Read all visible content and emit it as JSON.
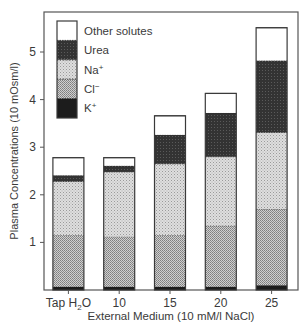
{
  "chart_data": {
    "type": "bar",
    "stacked": true,
    "title": "",
    "xlabel": "External Medium (10 mM/l NaCl)",
    "ylabel": "Plasma Concentrations (10 mOsm/l)",
    "ylim": [
      0,
      5.7
    ],
    "yticks": [
      1,
      2,
      3,
      4,
      5
    ],
    "grid": false,
    "legend_position": "top-left",
    "categories": [
      "Tap H2O",
      "10",
      "15",
      "20",
      "25"
    ],
    "category_labels": [
      {
        "main": "Tap H",
        "sub": "2",
        "tail": "O"
      },
      {
        "main": "10",
        "sub": "",
        "tail": ""
      },
      {
        "main": "15",
        "sub": "",
        "tail": ""
      },
      {
        "main": "20",
        "sub": "",
        "tail": ""
      },
      {
        "main": "25",
        "sub": "",
        "tail": ""
      }
    ],
    "series": [
      {
        "name": "K+",
        "label": "K",
        "sup": "+",
        "pattern": "dark",
        "values": [
          0.07,
          0.07,
          0.07,
          0.07,
          0.1
        ]
      },
      {
        "name": "Cl-",
        "label": "Cl",
        "sup": "−",
        "pattern": "dense-dots",
        "values": [
          1.08,
          1.05,
          1.08,
          1.28,
          1.6
        ]
      },
      {
        "name": "Na+",
        "label": "Na",
        "sup": "+",
        "pattern": "light-dots",
        "values": [
          1.13,
          1.36,
          1.5,
          1.45,
          1.61
        ]
      },
      {
        "name": "Urea",
        "label": "Urea",
        "sup": "",
        "pattern": "dark-grey",
        "values": [
          0.13,
          0.13,
          0.61,
          0.92,
          1.51
        ]
      },
      {
        "name": "Other solutes",
        "label": "Other solutes",
        "sup": "",
        "pattern": "white",
        "values": [
          0.37,
          0.17,
          0.4,
          0.41,
          0.69
        ]
      }
    ],
    "totals": [
      2.78,
      2.78,
      3.66,
      4.13,
      5.51
    ]
  },
  "colors": {
    "axis": "#555555",
    "k": "#1e1e1e",
    "urea": "#2e2e2e",
    "na_bg": "#d4d4d4",
    "cl_bg": "#bdbdbd",
    "other": "#ffffff"
  }
}
